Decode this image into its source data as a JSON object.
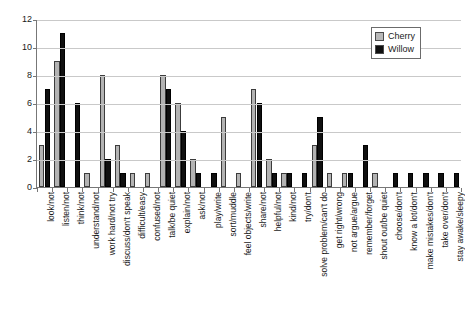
{
  "chart_data": {
    "type": "bar",
    "title": "",
    "subtitle": "",
    "xlabel": "",
    "ylabel": "",
    "ylim": [
      0,
      12
    ],
    "yticks": [
      0,
      2,
      4,
      6,
      8,
      10,
      12
    ],
    "grid": true,
    "legend_position": "top-right",
    "categories": [
      "look/not",
      "listen/not",
      "think/not",
      "understand/not",
      "work hard/not try",
      "discuss/don't speak",
      "difficult/easy",
      "confused/not",
      "talk/be quiet",
      "explain/not",
      "ask/not",
      "play/write",
      "sort/muddle",
      "feel objects/write",
      "share/not",
      "helpful/not",
      "kind/not",
      "try/don't",
      "solve problem/can't do",
      "get right/wrong",
      "not argue/argue",
      "remember/forget",
      "shout out/be quiet",
      "choose/don't",
      "know a lot/don't",
      "make mistakes/don't",
      "take over/don't",
      "stay awake/sleepy"
    ],
    "series": [
      {
        "name": "Cherry",
        "color": "#b3b3b3",
        "values": [
          3,
          9,
          0,
          1,
          8,
          3,
          1,
          1,
          8,
          6,
          2,
          0,
          5,
          1,
          7,
          2,
          1,
          0,
          3,
          1,
          1,
          0,
          1,
          0,
          0,
          0,
          0,
          0
        ]
      },
      {
        "name": "Willow",
        "color": "#101010",
        "values": [
          7,
          11,
          6,
          0,
          2,
          1,
          0,
          0,
          7,
          4,
          1,
          1,
          0,
          0,
          6,
          1,
          1,
          1,
          5,
          0,
          1,
          3,
          0,
          1,
          1,
          1,
          1,
          1
        ]
      }
    ]
  },
  "legend": {
    "items": [
      {
        "label": "Cherry"
      },
      {
        "label": "Willow"
      }
    ]
  }
}
